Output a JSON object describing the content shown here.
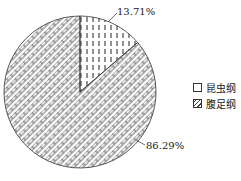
{
  "chart_data": {
    "type": "pie",
    "title": "",
    "categories": [
      "昆虫纲",
      "腹足纲"
    ],
    "values": [
      13.71,
      86.29
    ],
    "labels": [
      "13.71%",
      "86.29%"
    ],
    "legend_position": "right",
    "patterns": [
      "vertical-dashes",
      "brick-diagonal"
    ]
  },
  "legend": [
    {
      "label": "昆虫纲"
    },
    {
      "label": "腹足纲"
    }
  ]
}
